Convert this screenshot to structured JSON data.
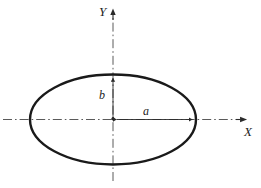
{
  "figure": {
    "kind": "ellipse-diagram",
    "width": 261,
    "height": 188,
    "background_color": "#ffffff",
    "curve_color": "#1a1a1a",
    "axis_color": "#4a4a4a",
    "label_color": "#1c1c1c"
  },
  "labels": {
    "y_axis": "Y",
    "x_axis": "X",
    "semi_minor": "b",
    "semi_major": "a"
  },
  "chart_data": {
    "type": "scatter",
    "title": "",
    "subtitle": "",
    "xlabel": "X",
    "ylabel": "Y",
    "grid": false,
    "legend": null,
    "origin": {
      "x": 113,
      "y": 119.5
    },
    "shapes": [
      {
        "name": "ellipse",
        "type": "ellipse",
        "center": [
          113,
          119.5
        ],
        "semi_major_axis_a": 83,
        "semi_minor_axis_b": 45,
        "stroke": "#1a1a1a",
        "stroke_width": 2.4,
        "fill": "none"
      }
    ],
    "axes": [
      {
        "name": "x-axis",
        "orientation": "horizontal",
        "from": [
          3,
          119.5
        ],
        "to": [
          246,
          119.5
        ],
        "style": "dash-dot",
        "arrow": "end",
        "label": "X"
      },
      {
        "name": "y-axis",
        "orientation": "vertical",
        "from": [
          113,
          181
        ],
        "to": [
          113,
          9
        ],
        "style": "dash-dot",
        "arrow": "end",
        "label": "Y"
      }
    ],
    "dimensions": [
      {
        "name": "semi-minor-b",
        "label": "b",
        "from": [
          113,
          119.5
        ],
        "to": [
          113,
          74.5
        ],
        "value_symbol": "b",
        "arrows": "both"
      },
      {
        "name": "semi-major-a",
        "label": "a",
        "from": [
          113,
          119.5
        ],
        "to": [
          196,
          119.5
        ],
        "value_symbol": "a",
        "arrows": "both"
      }
    ],
    "annotations": [
      {
        "text": "Y",
        "x": 103,
        "y": 12,
        "style": "italic-serif"
      },
      {
        "text": "X",
        "x": 249,
        "y": 133,
        "style": "italic-serif"
      },
      {
        "text": "b",
        "x": 102,
        "y": 96,
        "style": "italic-serif"
      },
      {
        "text": "a",
        "x": 148,
        "y": 112,
        "style": "italic-serif"
      }
    ]
  }
}
